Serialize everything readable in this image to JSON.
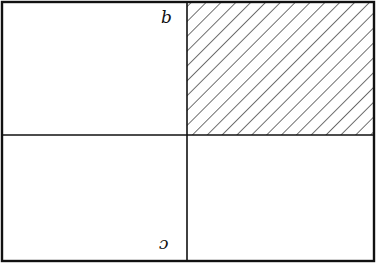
{
  "figure": {
    "type": "partitioned rectangle",
    "quadrants": [
      {
        "position": "top-left",
        "shaded": false,
        "label": "b"
      },
      {
        "position": "top-right",
        "shaded": true,
        "label": ""
      },
      {
        "position": "bottom-left",
        "shaded": false,
        "label": "c",
        "label_rotated": true
      },
      {
        "position": "bottom-right",
        "shaded": false,
        "label": ""
      }
    ],
    "labels": {
      "top_left": "b",
      "bottom_left": "c"
    },
    "colors": {
      "stroke": "#111111",
      "background": "#ffffff",
      "hatch": "#333333"
    }
  }
}
